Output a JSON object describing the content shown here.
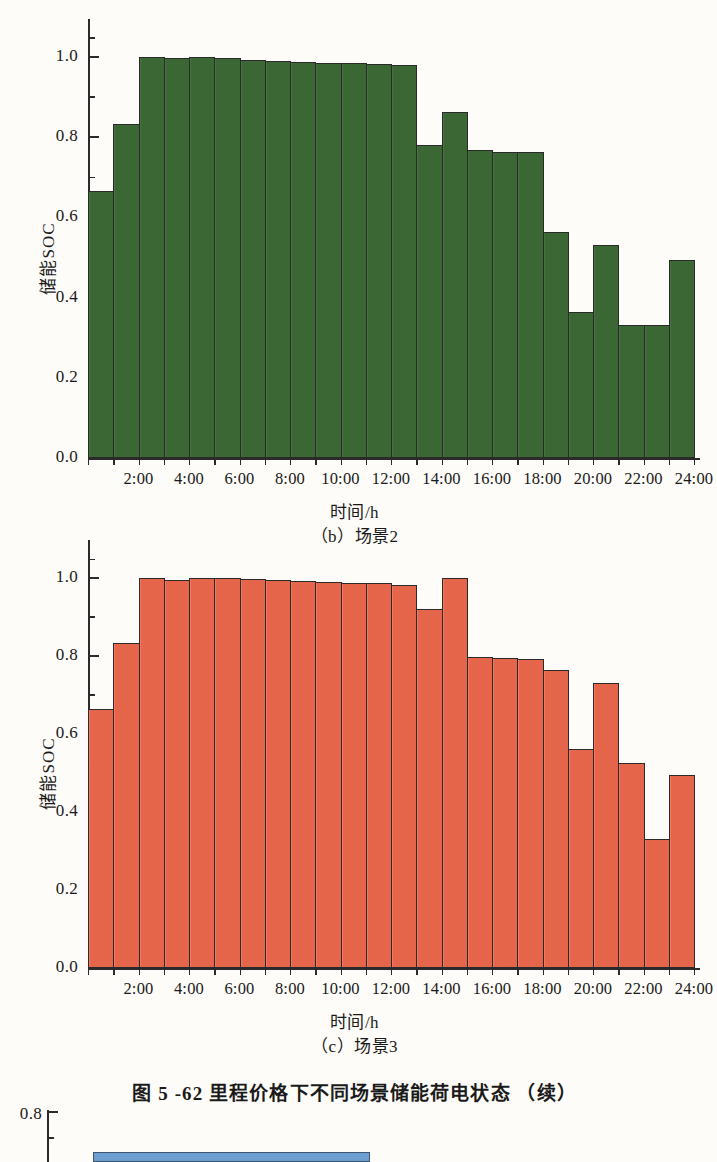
{
  "figure": {
    "caption": "图 5 -62    里程价格下不同场景储能荷电状态 （续）"
  },
  "panels": [
    {
      "id": "panel-b",
      "caption": "（b）场景2",
      "color": "#3d6b37",
      "axis_title_x": "时间/h",
      "axis_title_y": "储能SOC"
    },
    {
      "id": "panel-c",
      "caption": "（c）场景3",
      "color": "#ef6a4d",
      "axis_title_x": "时间/h",
      "axis_title_y": "储能SOC"
    }
  ],
  "y_ticks": [
    "0.0",
    "0.2",
    "0.4",
    "0.6",
    "0.8",
    "1.0"
  ],
  "x_ticks": [
    "2:00",
    "4:00",
    "6:00",
    "8:00",
    "10:00",
    "12:00",
    "14:00",
    "16:00",
    "18:00",
    "20:00",
    "22:00",
    "24:00"
  ],
  "partial_chart": {
    "y_tick_top": "0.8"
  },
  "chart_data": [
    {
      "type": "bar",
      "id": "panel-b",
      "title": "（b）场景2",
      "xlabel": "时间/h",
      "ylabel": "储能SOC",
      "ylim": [
        0.0,
        1.08
      ],
      "yticks": [
        0.0,
        0.2,
        0.4,
        0.6,
        0.8,
        1.0
      ],
      "grid": false,
      "legend": "none",
      "color": "#3d6b37",
      "categories": [
        "1:00",
        "2:00",
        "3:00",
        "4:00",
        "5:00",
        "6:00",
        "7:00",
        "8:00",
        "9:00",
        "10:00",
        "11:00",
        "12:00",
        "13:00",
        "14:00",
        "15:00",
        "16:00",
        "17:00",
        "18:00",
        "19:00",
        "20:00",
        "21:00",
        "22:00",
        "23:00",
        "24:00"
      ],
      "values": [
        0.665,
        0.833,
        1.0,
        0.997,
        1.0,
        0.997,
        0.993,
        0.991,
        0.988,
        0.986,
        0.985,
        0.983,
        0.981,
        0.781,
        0.862,
        0.767,
        0.764,
        0.763,
        0.563,
        0.365,
        0.531,
        0.331,
        0.331,
        0.495
      ],
      "xtick_labels": [
        "2:00",
        "4:00",
        "6:00",
        "8:00",
        "10:00",
        "12:00",
        "14:00",
        "16:00",
        "18:00",
        "20:00",
        "22:00",
        "24:00"
      ]
    },
    {
      "type": "bar",
      "id": "panel-c",
      "title": "（c）场景3",
      "xlabel": "时间/h",
      "ylabel": "储能SOC",
      "ylim": [
        0.0,
        1.08
      ],
      "yticks": [
        0.0,
        0.2,
        0.4,
        0.6,
        0.8,
        1.0
      ],
      "grid": false,
      "legend": "none",
      "color": "#ef6a4d",
      "categories": [
        "1:00",
        "2:00",
        "3:00",
        "4:00",
        "5:00",
        "6:00",
        "7:00",
        "8:00",
        "9:00",
        "10:00",
        "11:00",
        "12:00",
        "13:00",
        "14:00",
        "15:00",
        "16:00",
        "17:00",
        "18:00",
        "19:00",
        "20:00",
        "21:00",
        "22:00",
        "23:00",
        "24:00"
      ],
      "values": [
        0.665,
        0.833,
        0.999,
        0.996,
        1.0,
        0.999,
        0.997,
        0.995,
        0.992,
        0.99,
        0.988,
        0.986,
        0.983,
        0.921,
        1.0,
        0.797,
        0.796,
        0.793,
        0.763,
        0.561,
        0.73,
        0.525,
        0.331,
        0.495
      ],
      "xtick_labels": [
        "2:00",
        "4:00",
        "6:00",
        "8:00",
        "10:00",
        "12:00",
        "14:00",
        "16:00",
        "18:00",
        "20:00",
        "22:00",
        "24:00"
      ]
    }
  ]
}
